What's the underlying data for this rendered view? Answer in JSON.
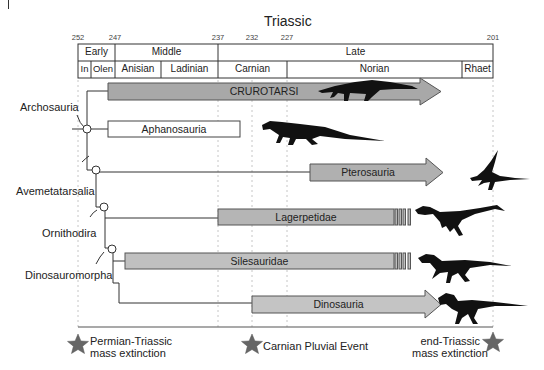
{
  "header": {
    "title": "Triassic",
    "ticks": [
      {
        "label": "252",
        "x": 78
      },
      {
        "label": "247",
        "x": 115
      },
      {
        "label": "237",
        "x": 218
      },
      {
        "label": "232",
        "x": 252
      },
      {
        "label": "227",
        "x": 287
      },
      {
        "label": "201",
        "x": 493
      }
    ],
    "epochs": [
      {
        "label": "Early",
        "x1": 78,
        "x2": 115
      },
      {
        "label": "Middle",
        "x1": 115,
        "x2": 218
      },
      {
        "label": "Late",
        "x1": 218,
        "x2": 493
      }
    ],
    "stages": [
      {
        "label": "In",
        "x1": 78,
        "x2": 91
      },
      {
        "label": "Olen",
        "x1": 91,
        "x2": 115
      },
      {
        "label": "Anisian",
        "x1": 115,
        "x2": 161
      },
      {
        "label": "Ladinian",
        "x1": 161,
        "x2": 218
      },
      {
        "label": "Carnian",
        "x1": 218,
        "x2": 287
      },
      {
        "label": "Norian",
        "x1": 287,
        "x2": 462
      },
      {
        "label": "Rhaet",
        "x1": 462,
        "x2": 493
      }
    ]
  },
  "clades": {
    "archosauria": "Archosauria",
    "avemetatarsalia": "Avemetatarsalia",
    "ornithodira": "Ornithodira",
    "dinosauromorpha": "Dinosauromorpha"
  },
  "taxa": [
    {
      "label": "CRUROTARSI",
      "type": "arrow",
      "x1": 108,
      "x2": 441,
      "y": 83,
      "h": 17,
      "fill": "#a8a8a8"
    },
    {
      "label": "Aphanosauria",
      "type": "box",
      "x1": 108,
      "x2": 240,
      "y": 121,
      "h": 16,
      "fill": "#ffffff"
    },
    {
      "label": "Pterosauria",
      "type": "arrow",
      "x1": 310,
      "x2": 443,
      "y": 164,
      "h": 17,
      "fill": "#b0b0b0"
    },
    {
      "label": "Lagerpetidae",
      "type": "striped",
      "x1": 218,
      "x2": 394,
      "y": 209,
      "h": 16,
      "fill": "#b5b5b5"
    },
    {
      "label": "Silesauridae",
      "type": "striped",
      "x1": 125,
      "x2": 394,
      "y": 253,
      "h": 16,
      "fill": "#c0c0c0"
    },
    {
      "label": "Dinosauria",
      "type": "arrow",
      "x1": 252,
      "x2": 441,
      "y": 296,
      "h": 17,
      "fill": "#c4c4c4"
    }
  ],
  "events": [
    {
      "label_line1": "Permian-Triassic",
      "label_line2": "mass extinction"
    },
    {
      "label_line1": "Carnian Pluvial Event",
      "label_line2": ""
    },
    {
      "label_line1": "end-Triassic",
      "label_line2": "mass extinction"
    }
  ],
  "colors": {
    "star": "#666666",
    "silhouette": "#111111",
    "line": "#333333",
    "dashed": "#bbbbbb"
  }
}
